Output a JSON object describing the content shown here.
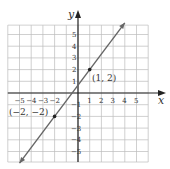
{
  "chart_data": {
    "type": "line",
    "title": "",
    "xlabel": "x",
    "ylabel": "y",
    "xlim": [
      -6,
      6
    ],
    "ylim": [
      -6,
      6
    ],
    "grid": true,
    "x_ticks": [
      "-5",
      "-4",
      "-3",
      "-2",
      "1",
      "2",
      "3",
      "4",
      "5"
    ],
    "y_ticks": [
      "5",
      "4",
      "3",
      "2",
      "1",
      "-1",
      "-2",
      "-3",
      "-4",
      "-5"
    ],
    "series": [
      {
        "name": "line",
        "equation": "y = (4/3)x + 2/3",
        "x": [
          -5,
          4
        ],
        "y": [
          -6,
          6
        ]
      }
    ],
    "points": [
      {
        "label": "(1, 2)",
        "x": 1,
        "y": 2
      },
      {
        "label": "(−2, −2)",
        "x": -2,
        "y": -2
      }
    ]
  },
  "labels": {
    "x_axis": "x",
    "y_axis": "y",
    "point_a": "(1, 2)",
    "point_b": "(−2, −2)"
  }
}
